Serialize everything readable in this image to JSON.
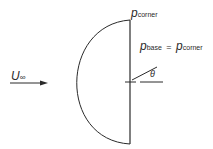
{
  "diagram": {
    "type": "half-body (hemispherical nose) in flow",
    "labels": {
      "freestream_symbol": "U",
      "freestream_sub": "∞",
      "corner_symbol": "p",
      "corner_sub": "corner",
      "base_symbol": "p",
      "base_sub": "base",
      "equals": "=",
      "base_rhs_symbol": "p",
      "base_rhs_sub": "corner",
      "angle": "θ"
    },
    "colors": {
      "stroke": "#2a2a2a",
      "background": "#ffffff"
    }
  }
}
